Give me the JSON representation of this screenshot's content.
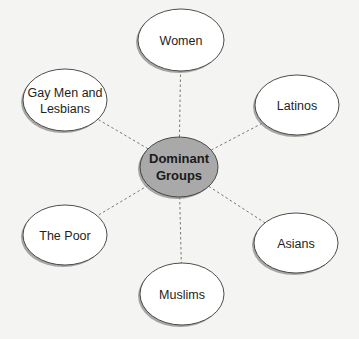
{
  "diagram": {
    "type": "hub-and-spoke",
    "colors": {
      "background": "#f4f4f2",
      "node_fill": "#ffffff",
      "center_fill": "#a9a9a9",
      "stroke": "#3a3a3a",
      "shadow": "#8c8c8c",
      "connector": "#6a6a6a"
    },
    "center": {
      "id": "dominant-groups",
      "lines": [
        "Dominant",
        "Groups"
      ],
      "cx": 179,
      "cy": 167,
      "rx": 39,
      "ry": 30
    },
    "nodes": [
      {
        "id": "women",
        "lines": [
          "Women"
        ],
        "cx": 181,
        "cy": 40,
        "rx": 43,
        "ry": 31
      },
      {
        "id": "gay-men-and-lesbians",
        "lines": [
          "Gay Men and",
          "Lesbians"
        ],
        "cx": 65,
        "cy": 100,
        "rx": 42,
        "ry": 31
      },
      {
        "id": "latinos",
        "lines": [
          "Latinos"
        ],
        "cx": 297,
        "cy": 105,
        "rx": 42,
        "ry": 30
      },
      {
        "id": "the-poor",
        "lines": [
          "The Poor"
        ],
        "cx": 65,
        "cy": 235,
        "rx": 42,
        "ry": 30
      },
      {
        "id": "asians",
        "lines": [
          "Asians"
        ],
        "cx": 296,
        "cy": 243,
        "rx": 42,
        "ry": 30
      },
      {
        "id": "muslims",
        "lines": [
          "Muslims"
        ],
        "cx": 182,
        "cy": 294,
        "rx": 42,
        "ry": 31
      }
    ]
  }
}
